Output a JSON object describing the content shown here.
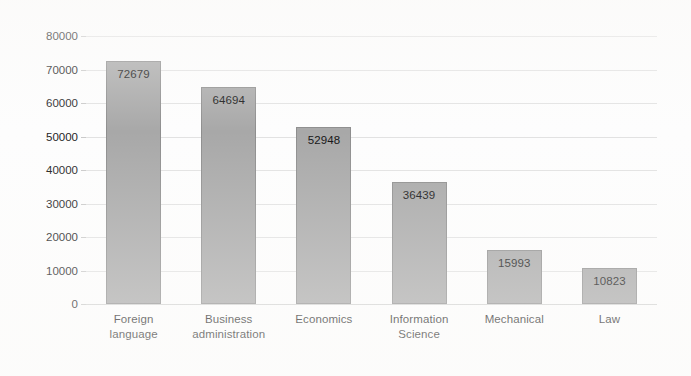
{
  "chart_data": {
    "type": "bar",
    "title": "",
    "subtitle": "",
    "xlabel": "",
    "ylabel": "",
    "categories": [
      "Foreign language",
      "Business administration",
      "Economics",
      "Information Science",
      "Mechanical",
      "Law"
    ],
    "category_lines": [
      [
        "Foreign",
        "language"
      ],
      [
        "Business",
        "administration"
      ],
      [
        "Economics"
      ],
      [
        "Information",
        "Science"
      ],
      [
        "Mechanical"
      ],
      [
        "Law"
      ]
    ],
    "values": [
      72679,
      64694,
      52948,
      36439,
      15993,
      10823
    ],
    "value_labels": [
      "72679",
      "64694",
      "52948",
      "36439",
      "15993",
      "10823"
    ],
    "ylim": [
      0,
      80000
    ],
    "yticks": [
      0,
      10000,
      20000,
      30000,
      40000,
      50000,
      60000,
      70000,
      80000
    ],
    "ytick_labels": [
      "0",
      "10000",
      "20000",
      "30000",
      "40000",
      "50000",
      "60000",
      "70000",
      "80000"
    ],
    "grid": true,
    "legend": false,
    "legend_position": "none",
    "bar_color": "#a8a8a8",
    "bar_border_color": "#8e8e8e",
    "gridline_color": "#e2e2e2",
    "axis_color": "#d2d2d2",
    "text_color": "#1d1d1d",
    "background_color": "#fdfdfd",
    "data_label_position": "inside-top"
  }
}
